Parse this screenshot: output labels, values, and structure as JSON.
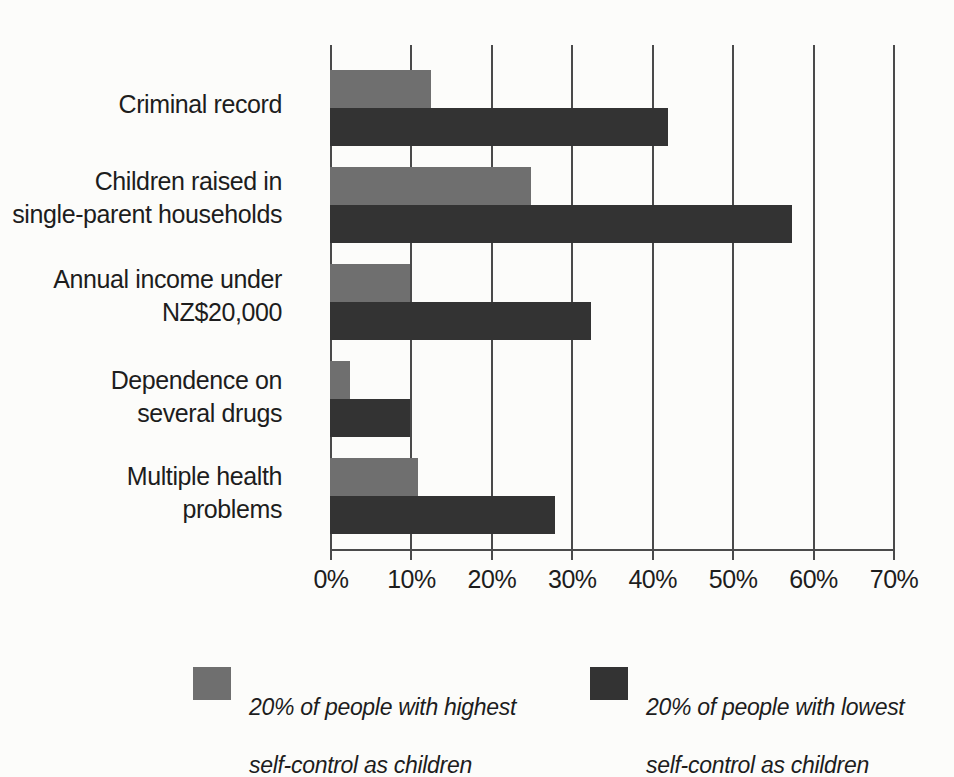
{
  "chart_data": {
    "type": "bar",
    "orientation": "horizontal",
    "title": "",
    "xlabel": "",
    "ylabel": "",
    "xlim": [
      0,
      70
    ],
    "grid": true,
    "grid_axis": "x",
    "legend_position": "bottom",
    "categories": [
      "Criminal record",
      "Children raised in\nsingle-parent households",
      "Annual income under\nNZ$20,000",
      "Dependence on\nseveral drugs",
      "Multiple health\nproblems"
    ],
    "tick_labels": [
      "0%",
      "10%",
      "20%",
      "30%",
      "40%",
      "50%",
      "60%",
      "70%"
    ],
    "tick_values": [
      0,
      10,
      20,
      30,
      40,
      50,
      60,
      70
    ],
    "series": [
      {
        "name": "20% of people with highest self-control as children",
        "color": "#6f6f6f",
        "values": [
          12.5,
          25,
          10,
          2.5,
          11
        ]
      },
      {
        "name": "20% of people with lowest self-control as children",
        "color": "#333333",
        "values": [
          42,
          57.5,
          32.5,
          10,
          28
        ]
      }
    ]
  },
  "legend": {
    "items": [
      {
        "swatch": "light",
        "line1_prefix": "20% of people with ",
        "line1_emph": "highest",
        "line2": "self-control as children"
      },
      {
        "swatch": "dark",
        "line1_prefix": "20% of people with ",
        "line1_emph": "lowest",
        "line2": "self-control as children"
      }
    ]
  },
  "colors": {
    "light_bar": "#6f6f6f",
    "dark_bar": "#333333",
    "axis": "#4a4a4a",
    "background": "#fcfcfa",
    "text": "#1d1d1d"
  }
}
